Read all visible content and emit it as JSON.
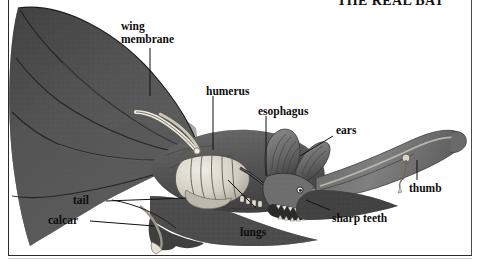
{
  "page": {
    "title": "THE REAL BAT",
    "background_color": "#ffffff",
    "ink_color": "#111111",
    "frame_color": "#2b2b2b",
    "width": 481,
    "height": 268
  },
  "figure": {
    "subject": "bat",
    "view": "anatomical cutaway, wings outspread, head in right profile",
    "style": "engraved halftone illustration, grayscale",
    "labels": [
      {
        "id": "wing-membrane",
        "text": "wing\nmembrane"
      },
      {
        "id": "humerus",
        "text": "humerus"
      },
      {
        "id": "esophagus",
        "text": "esophagus"
      },
      {
        "id": "ears",
        "text": "ears"
      },
      {
        "id": "thumb",
        "text": "thumb"
      },
      {
        "id": "tail",
        "text": "tail"
      },
      {
        "id": "calcar",
        "text": "calcar"
      },
      {
        "id": "lungs",
        "text": "lungs"
      },
      {
        "id": "sharp-teeth",
        "text": "sharp teeth"
      }
    ]
  }
}
